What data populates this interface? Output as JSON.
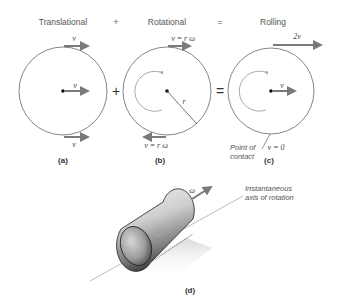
{
  "headers": {
    "translational": "Translational",
    "plus": "+",
    "rotational": "Rotational",
    "equals": "=",
    "rolling": "Rolling"
  },
  "operators": {
    "plus": "+",
    "equals": "="
  },
  "panel_a": {
    "label": "(a)",
    "top_velocity": "v",
    "center_velocity": "v",
    "bottom_velocity": "v"
  },
  "panel_b": {
    "label": "(b)",
    "top_velocity": "v = r ω",
    "bottom_velocity": "v = r ω",
    "radius_label": "r"
  },
  "panel_c": {
    "label": "(c)",
    "top_velocity": "2v",
    "center_velocity": "v",
    "contact_velocity": "v = 0",
    "contact_label_line1": "Point of",
    "contact_label_line2": "contact"
  },
  "panel_d": {
    "label": "(d)",
    "omega_label": "ω",
    "axis_label_line1": "Instantaneous",
    "axis_label_line2": "axis of rotation"
  },
  "colors": {
    "arrow": "#7a7a7a",
    "circle": "#666666",
    "curl": "#aaaaaa"
  }
}
